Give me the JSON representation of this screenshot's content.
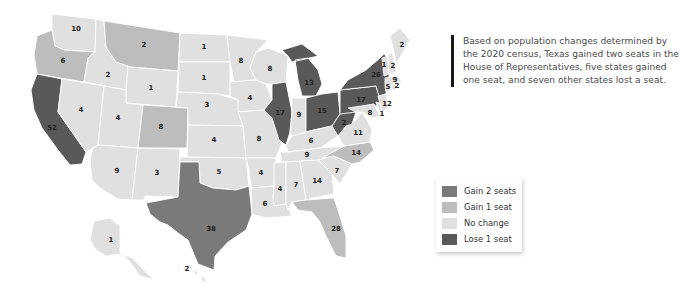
{
  "caption": "Based on population changes determined by the 2020 census, Texas gained two seats in the House of Representatives, five states gained one seat, and seven other states lost a seat.",
  "colors": {
    "gain2": "#7a7a7a",
    "gain1": "#bdbdbd",
    "nochange": "#e0e0e0",
    "lose1": "#595959"
  },
  "legend": [
    {
      "key": "gain2",
      "label": "Gain 2 seats"
    },
    {
      "key": "gain1",
      "label": "Gain 1 seat"
    },
    {
      "key": "nochange",
      "label": "No change"
    },
    {
      "key": "lose1",
      "label": "Lose 1 seat"
    }
  ],
  "states": [
    {
      "id": "WA",
      "name": "Washington",
      "seats": "10",
      "change": "nochange"
    },
    {
      "id": "OR",
      "name": "Oregon",
      "seats": "6",
      "change": "gain1"
    },
    {
      "id": "CA",
      "name": "California",
      "seats": "52",
      "change": "lose1"
    },
    {
      "id": "ID",
      "name": "Idaho",
      "seats": "2",
      "change": "nochange"
    },
    {
      "id": "NV",
      "name": "Nevada",
      "seats": "4",
      "change": "nochange"
    },
    {
      "id": "MT",
      "name": "Montana",
      "seats": "2",
      "change": "gain1"
    },
    {
      "id": "WY",
      "name": "Wyoming",
      "seats": "1",
      "change": "nochange"
    },
    {
      "id": "UT",
      "name": "Utah",
      "seats": "4",
      "change": "nochange"
    },
    {
      "id": "AZ",
      "name": "Arizona",
      "seats": "9",
      "change": "nochange"
    },
    {
      "id": "CO",
      "name": "Colorado",
      "seats": "8",
      "change": "gain1"
    },
    {
      "id": "NM",
      "name": "New Mexico",
      "seats": "3",
      "change": "nochange"
    },
    {
      "id": "ND",
      "name": "North Dakota",
      "seats": "1",
      "change": "nochange"
    },
    {
      "id": "SD",
      "name": "South Dakota",
      "seats": "1",
      "change": "nochange"
    },
    {
      "id": "NE",
      "name": "Nebraska",
      "seats": "3",
      "change": "nochange"
    },
    {
      "id": "KS",
      "name": "Kansas",
      "seats": "4",
      "change": "nochange"
    },
    {
      "id": "OK",
      "name": "Oklahoma",
      "seats": "5",
      "change": "nochange"
    },
    {
      "id": "TX",
      "name": "Texas",
      "seats": "38",
      "change": "gain2"
    },
    {
      "id": "MN",
      "name": "Minnesota",
      "seats": "8",
      "change": "nochange"
    },
    {
      "id": "IA",
      "name": "Iowa",
      "seats": "4",
      "change": "nochange"
    },
    {
      "id": "MO",
      "name": "Missouri",
      "seats": "8",
      "change": "nochange"
    },
    {
      "id": "AR",
      "name": "Arkansas",
      "seats": "4",
      "change": "nochange"
    },
    {
      "id": "LA",
      "name": "Louisiana",
      "seats": "6",
      "change": "nochange"
    },
    {
      "id": "WI",
      "name": "Wisconsin",
      "seats": "8",
      "change": "nochange"
    },
    {
      "id": "IL",
      "name": "Illinois",
      "seats": "17",
      "change": "lose1"
    },
    {
      "id": "MI",
      "name": "Michigan",
      "seats": "13",
      "change": "lose1"
    },
    {
      "id": "IN",
      "name": "Indiana",
      "seats": "9",
      "change": "nochange"
    },
    {
      "id": "OH",
      "name": "Ohio",
      "seats": "15",
      "change": "lose1"
    },
    {
      "id": "KY",
      "name": "Kentucky",
      "seats": "6",
      "change": "nochange"
    },
    {
      "id": "TN",
      "name": "Tennessee",
      "seats": "9",
      "change": "nochange"
    },
    {
      "id": "MS",
      "name": "Mississippi",
      "seats": "4",
      "change": "nochange"
    },
    {
      "id": "AL",
      "name": "Alabama",
      "seats": "7",
      "change": "nochange"
    },
    {
      "id": "GA",
      "name": "Georgia",
      "seats": "14",
      "change": "nochange"
    },
    {
      "id": "FL",
      "name": "Florida",
      "seats": "28",
      "change": "gain1"
    },
    {
      "id": "SC",
      "name": "South Carolina",
      "seats": "7",
      "change": "nochange"
    },
    {
      "id": "NC",
      "name": "North Carolina",
      "seats": "14",
      "change": "gain1"
    },
    {
      "id": "VA",
      "name": "Virginia",
      "seats": "11",
      "change": "nochange"
    },
    {
      "id": "WV",
      "name": "West Virginia",
      "seats": "2",
      "change": "lose1"
    },
    {
      "id": "PA",
      "name": "Pennsylvania",
      "seats": "17",
      "change": "lose1"
    },
    {
      "id": "NY",
      "name": "New York",
      "seats": "26",
      "change": "lose1"
    },
    {
      "id": "MD",
      "name": "Maryland",
      "seats": "8",
      "change": "nochange"
    },
    {
      "id": "DE",
      "name": "Delaware",
      "seats": "1",
      "change": "nochange"
    },
    {
      "id": "NJ",
      "name": "New Jersey",
      "seats": "12",
      "change": "nochange"
    },
    {
      "id": "CT",
      "name": "Connecticut",
      "seats": "5",
      "change": "nochange"
    },
    {
      "id": "RI",
      "name": "Rhode Island",
      "seats": "2",
      "change": "nochange"
    },
    {
      "id": "MA",
      "name": "Massachusetts",
      "seats": "9",
      "change": "nochange"
    },
    {
      "id": "VT",
      "name": "Vermont",
      "seats": "1",
      "change": "nochange"
    },
    {
      "id": "NH",
      "name": "New Hampshire",
      "seats": "2",
      "change": "nochange"
    },
    {
      "id": "ME",
      "name": "Maine",
      "seats": "2",
      "change": "nochange"
    },
    {
      "id": "AK",
      "name": "Alaska",
      "seats": "1",
      "change": "nochange"
    },
    {
      "id": "HI",
      "name": "Hawaii",
      "seats": "2",
      "change": "nochange"
    }
  ]
}
